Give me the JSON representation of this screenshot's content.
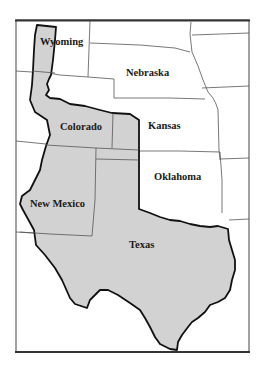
{
  "map": {
    "colors": {
      "background": "#ffffff",
      "highlight_fill": "#d2d2d2",
      "highlight_outline": "#111111",
      "state_borders": "#555555",
      "frame": "#333333",
      "label_text": "#1a1a1a"
    },
    "labels": {
      "wyoming": "Wyoming",
      "nebraska": "Nebraska",
      "colorado": "Colorado",
      "kansas": "Kansas",
      "oklahoma": "Oklahoma",
      "new_mexico": "New Mexico",
      "texas": "Texas"
    },
    "highlighted_region_states": [
      "Wyoming (part)",
      "Colorado (part)",
      "Kansas (part)",
      "Oklahoma (part)",
      "New Mexico (part)",
      "Texas"
    ]
  }
}
